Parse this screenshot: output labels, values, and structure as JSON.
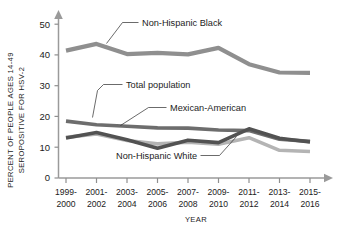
{
  "chart_data": {
    "type": "line",
    "title": "",
    "xlabel": "YEAR",
    "ylabel": "PERCENT OF PEOPLE AGES 14-49 SEROPOSITIVE FOR HSV-2",
    "ylabel_line1": "PERCENT OF PEOPLE AGES 14-49",
    "ylabel_line2": "SEROPOSITIVE FOR HSV-2",
    "categories": [
      "1999-2000",
      "2001-2002",
      "2003-2004",
      "2005-2006",
      "2007-2008",
      "2009-2010",
      "2011-2012",
      "2013-2014",
      "2015-2016"
    ],
    "category_lines": [
      [
        "1999-",
        "2000"
      ],
      [
        "2001-",
        "2002"
      ],
      [
        "2003-",
        "2004"
      ],
      [
        "2005-",
        "2006"
      ],
      [
        "2007-",
        "2008"
      ],
      [
        "2009-",
        "2010"
      ],
      [
        "2011-",
        "2012"
      ],
      [
        "2013-",
        "2014"
      ],
      [
        "2015-",
        "2016"
      ]
    ],
    "ylim": [
      0,
      52
    ],
    "yticks": [
      0,
      10,
      20,
      30,
      40,
      50
    ],
    "ytick_labels": [
      "0",
      "10",
      "20",
      "30",
      "40",
      "50"
    ],
    "grid": false,
    "legend": "annotations-on-plot",
    "series": [
      {
        "name": "Non-Hispanic Black",
        "color": "#8f8f8f",
        "width": 4.2,
        "values": [
          41.4,
          43.6,
          40.3,
          40.7,
          40.2,
          42.3,
          37.0,
          34.3,
          34.2
        ]
      },
      {
        "name": "Total population",
        "color": "#6d6d6d",
        "width": 3.6,
        "values": [
          18.5,
          17.3,
          16.8,
          16.3,
          16.2,
          15.6,
          15.4,
          12.6,
          11.9
        ]
      },
      {
        "name": "Mexican-American",
        "color": "#525252",
        "width": 3.6,
        "values": [
          13.0,
          14.8,
          12.4,
          9.7,
          12.3,
          11.5,
          16.0,
          12.9,
          11.7
        ]
      },
      {
        "name": "Non-Hispanic White",
        "color": "#b4b4b4",
        "width": 3.6,
        "values": [
          13.2,
          14.3,
          12.2,
          11.1,
          11.6,
          11.0,
          13.1,
          9.0,
          8.6
        ]
      }
    ],
    "annotations": [
      {
        "text": "Non-Hispanic Black",
        "series": "Non-Hispanic Black"
      },
      {
        "text": "Total population",
        "series": "Total population"
      },
      {
        "text": "Mexican-American",
        "series": "Mexican-American"
      },
      {
        "text": "Non-Hispanic White",
        "series": "Non-Hispanic White"
      }
    ]
  }
}
